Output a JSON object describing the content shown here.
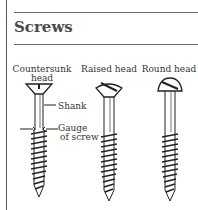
{
  "section": {
    "title": "Screws"
  },
  "diagram": {
    "screws": [
      {
        "label_line1": "Countersunk",
        "label_line2": "head",
        "type": "countersunk"
      },
      {
        "label_line1": "Raised head",
        "type": "raised"
      },
      {
        "label_line1": "Round head",
        "type": "round"
      }
    ],
    "annotations": {
      "shank": "Shank",
      "gauge_line1": "Gauge",
      "gauge_line2": "of screw"
    }
  }
}
